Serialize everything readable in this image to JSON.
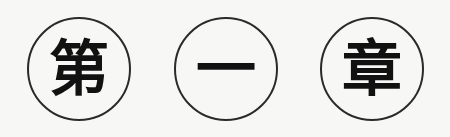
{
  "heading": {
    "characters": [
      "第",
      "一",
      "章"
    ],
    "meaning": "Chapter One"
  }
}
